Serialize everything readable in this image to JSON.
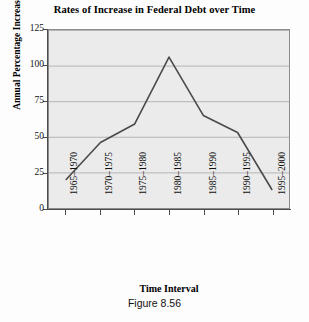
{
  "chart_data": {
    "type": "line",
    "title": "Rates of Increase in Federal Debt over Time",
    "xlabel": "Time Interval",
    "ylabel": "Annual Percentage Increase",
    "categories": [
      "1965–1970",
      "1970–1975",
      "1975–1980",
      "1980–1985",
      "1985–1990",
      "1990–1995",
      "1995–2000"
    ],
    "values": [
      20,
      46,
      59,
      106,
      65,
      53,
      13
    ],
    "ylim": [
      0,
      125
    ],
    "yticks": [
      0,
      25,
      50,
      75,
      100,
      125
    ],
    "ytick_labels": [
      "0",
      "25",
      "50",
      "75",
      "100",
      "125"
    ],
    "grid": true,
    "legend": false,
    "legend_position": "none",
    "series": [
      {
        "name": "Annual Percentage Increase",
        "values": [
          20,
          46,
          59,
          106,
          65,
          53,
          13
        ]
      }
    ]
  },
  "caption": {
    "text": "Figure 8.56"
  },
  "style": {
    "line_color": "#4a4a4a",
    "plot_background": "#ebebeb",
    "gridline_color": "#b4b4b4",
    "axis_color": "#4d4d4d",
    "page_background": "#fdfdfd",
    "text_color": "#111111"
  }
}
